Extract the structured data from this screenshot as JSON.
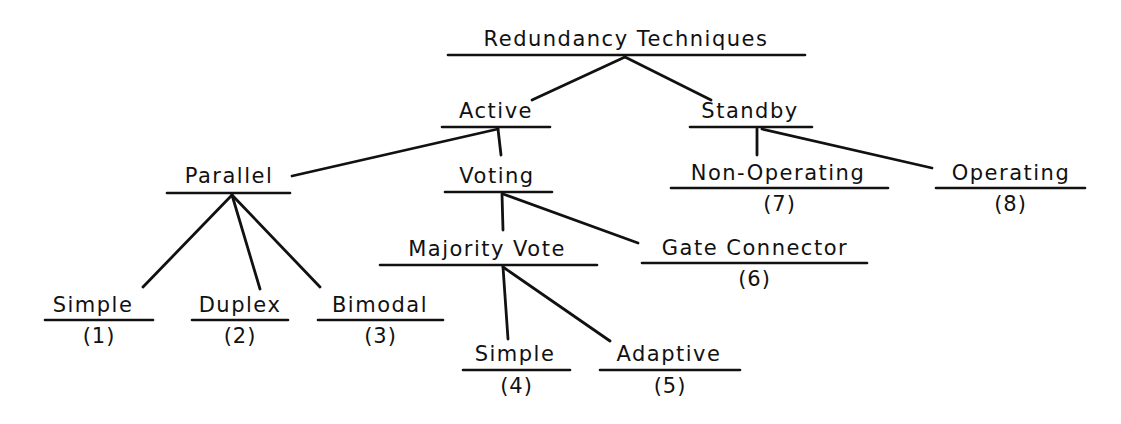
{
  "diagram": {
    "title": "Redundancy Techniques",
    "ink_color": "#111111",
    "background": "#ffffff",
    "nodes": {
      "root": {
        "label": "Redundancy Techniques",
        "cx": 626,
        "ty": 27,
        "ul": [
          448,
          805,
          55
        ]
      },
      "active": {
        "label": "Active",
        "cx": 496,
        "ty": 99,
        "ul": [
          442,
          550,
          127
        ]
      },
      "standby": {
        "label": "Standby",
        "cx": 750,
        "ty": 99,
        "ul": [
          690,
          812,
          127
        ]
      },
      "parallel": {
        "label": "Parallel",
        "cx": 229,
        "ty": 164,
        "ul": [
          167,
          290,
          193
        ]
      },
      "voting": {
        "label": "Voting",
        "cx": 497,
        "ty": 164,
        "ul": [
          445,
          552,
          192
        ]
      },
      "nonop": {
        "label": "Non-Operating",
        "cx": 778,
        "ty": 161,
        "ul": [
          671,
          888,
          188
        ],
        "number": "(7)"
      },
      "operating": {
        "label": "Operating",
        "cx": 1011,
        "ty": 161,
        "ul": [
          936,
          1085,
          188
        ],
        "number": "(8)"
      },
      "majority": {
        "label": "Majority Vote",
        "cx": 487,
        "ty": 237,
        "ul": [
          380,
          597,
          265
        ]
      },
      "gate": {
        "label": "Gate Connector",
        "cx": 755,
        "ty": 236,
        "ul": [
          642,
          867,
          263
        ],
        "number": "(6)"
      },
      "simple1": {
        "label": "Simple",
        "cx": 93,
        "ty": 293,
        "ul": [
          45,
          153,
          320
        ],
        "number": "(1)"
      },
      "duplex": {
        "label": "Duplex",
        "cx": 240,
        "ty": 293,
        "ul": [
          192,
          288,
          320
        ],
        "number": "(2)"
      },
      "bimodal": {
        "label": "Bimodal",
        "cx": 380,
        "ty": 293,
        "ul": [
          318,
          443,
          320
        ],
        "number": "(3)"
      },
      "simple4": {
        "label": "Simple",
        "cx": 515,
        "ty": 342,
        "ul": [
          463,
          570,
          370
        ],
        "number": "(4)"
      },
      "adaptive": {
        "label": "Adaptive",
        "cx": 669,
        "ty": 342,
        "ul": [
          600,
          740,
          370
        ],
        "number": "(5)"
      }
    },
    "edges": [
      {
        "from": "root",
        "to": "active",
        "pts": [
          625,
          57,
          532,
          100
        ]
      },
      {
        "from": "root",
        "to": "standby",
        "pts": [
          625,
          57,
          711,
          100
        ]
      },
      {
        "from": "active",
        "to": "parallel",
        "pts": [
          498,
          129,
          292,
          176
        ]
      },
      {
        "from": "active",
        "to": "voting",
        "pts": [
          498,
          129,
          501,
          155
        ]
      },
      {
        "from": "standby",
        "to": "nonop",
        "pts": [
          757,
          129,
          757,
          155
        ]
      },
      {
        "from": "standby",
        "to": "operating",
        "pts": [
          762,
          129,
          932,
          168
        ]
      },
      {
        "from": "parallel",
        "to": "simple1",
        "pts": [
          232,
          195,
          143,
          287
        ]
      },
      {
        "from": "parallel",
        "to": "duplex",
        "pts": [
          232,
          195,
          260,
          289
        ]
      },
      {
        "from": "parallel",
        "to": "bimodal",
        "pts": [
          232,
          195,
          320,
          287
        ]
      },
      {
        "from": "voting",
        "to": "majority",
        "pts": [
          502,
          194,
          503,
          230
        ]
      },
      {
        "from": "voting",
        "to": "gate",
        "pts": [
          503,
          194,
          638,
          243
        ]
      },
      {
        "from": "majority",
        "to": "simple4",
        "pts": [
          503,
          267,
          508,
          339
        ]
      },
      {
        "from": "majority",
        "to": "adaptive",
        "pts": [
          503,
          267,
          610,
          341
        ]
      }
    ]
  }
}
